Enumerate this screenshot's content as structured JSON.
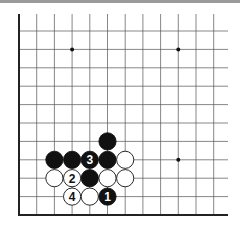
{
  "board": {
    "origin_x": 19,
    "origin_y": 215,
    "spacing_x": 17.7,
    "spacing_y": 18.4,
    "cols": 12,
    "rows": 11,
    "line_color": "#555555",
    "edge_color": "#222222",
    "star_points": [
      [
        3,
        9
      ],
      [
        9,
        9
      ],
      [
        9,
        3
      ]
    ],
    "stones": [
      {
        "col": 5,
        "row": 4,
        "color": "black",
        "label": ""
      },
      {
        "col": 2,
        "row": 3,
        "color": "black",
        "label": ""
      },
      {
        "col": 3,
        "row": 3,
        "color": "black",
        "label": ""
      },
      {
        "col": 4,
        "row": 3,
        "color": "black",
        "label": "3"
      },
      {
        "col": 5,
        "row": 3,
        "color": "black",
        "label": ""
      },
      {
        "col": 6,
        "row": 3,
        "color": "white",
        "label": ""
      },
      {
        "col": 2,
        "row": 2,
        "color": "white",
        "label": ""
      },
      {
        "col": 3,
        "row": 2,
        "color": "white",
        "label": "2"
      },
      {
        "col": 4,
        "row": 2,
        "color": "black",
        "label": ""
      },
      {
        "col": 5,
        "row": 2,
        "color": "white",
        "label": ""
      },
      {
        "col": 6,
        "row": 2,
        "color": "white",
        "label": ""
      },
      {
        "col": 3,
        "row": 1,
        "color": "white",
        "label": "4"
      },
      {
        "col": 4,
        "row": 1,
        "color": "white",
        "label": ""
      },
      {
        "col": 5,
        "row": 1,
        "color": "black",
        "label": "1"
      }
    ]
  }
}
